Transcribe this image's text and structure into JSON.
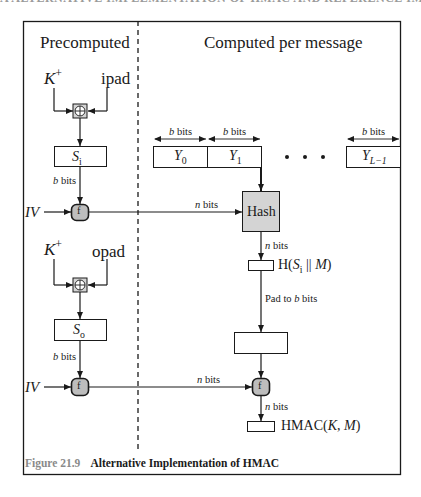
{
  "top_bleed_text": "A ALTERNATIVE IMPLEMENTATION OF HMAC AND REFERENCE IMPLEMENTATIONS",
  "headers": {
    "left": "Precomputed",
    "right": "Computed per message"
  },
  "inputs": {
    "key_inner": {
      "base": "K",
      "sup": "+"
    },
    "ipad": "ipad",
    "key_outer": {
      "base": "K",
      "sup": "+"
    },
    "opad": "opad",
    "iv_top": "IV",
    "iv_bottom": "IV"
  },
  "nodes": {
    "si": {
      "base": "S",
      "sub": "i"
    },
    "so": {
      "base": "S",
      "sub": "o"
    },
    "f_label": "f",
    "hash": "Hash",
    "xor_symbol": "⊕"
  },
  "blocks": [
    {
      "base": "Y",
      "sub": "0",
      "width_label": "b bits"
    },
    {
      "base": "Y",
      "sub": "1",
      "width_label": "b bits"
    },
    {
      "base": "Y",
      "sub": "L−1",
      "width_label": "b bits"
    }
  ],
  "ellipsis": "• • •",
  "labels": {
    "b_bits": "bits",
    "b_var": "b",
    "n_var": "n",
    "inner_hash": {
      "prefix": "H(",
      "s": "S",
      "sub": "i",
      "middle": " || ",
      "m": "M",
      "suffix": ")"
    },
    "pad_to": "Pad to ",
    "pad_suffix": " bits",
    "hmac": {
      "prefix": "HMAC(",
      "k": "K",
      "sep": ", ",
      "m": "M",
      "suffix": ")"
    }
  },
  "caption": {
    "figure_number": "Figure 21.9",
    "title": "Alternative Implementation of HMAC"
  },
  "colors": {
    "line": "#1a1a1a",
    "gray_fill": "#d4d4d4",
    "caption_gray": "#8a8a8a"
  }
}
